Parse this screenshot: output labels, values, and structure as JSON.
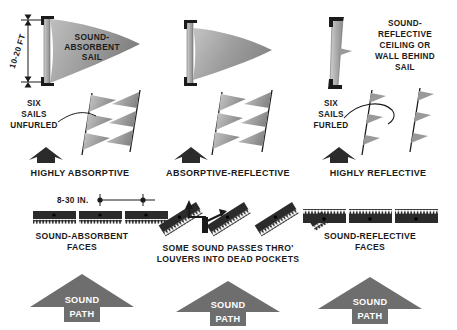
{
  "figure": {
    "colors": {
      "sail_light": "#c9c9c9",
      "sail_mid": "#9a9a9a",
      "sail_dark": "#7d7d7d",
      "mast_gray": "#b0b0b0",
      "ink": "#1a1a1a",
      "panel_dark": "#2b2b2b",
      "arrow_gray": "#6e6e6e",
      "path_arrow": "#6e6e6e",
      "background": "#ffffff"
    }
  },
  "top_row": {
    "panels": [
      {
        "id": "highly-absorptive",
        "dimension_label": "10-20 FT",
        "sail_label_lines": [
          "SOUND-",
          "ABSORBENT",
          "SAIL"
        ],
        "array_label_lines": [
          "SIX",
          "SAILS",
          "UNFURLED"
        ],
        "caption": "HIGHLY ABSORPTIVE"
      },
      {
        "id": "absorptive-reflective",
        "dimension_label": "",
        "sail_label_lines": [],
        "array_label_lines": [],
        "caption": "ABSORPTIVE-REFLECTIVE"
      },
      {
        "id": "highly-reflective",
        "dimension_label": "",
        "sail_label_lines": [
          "SOUND-",
          "REFLECTIVE",
          "CEILING OR",
          "WALL BEHIND",
          "SAIL"
        ],
        "array_label_lines": [
          "SIX",
          "SAILS",
          "FURLED"
        ],
        "caption": "HIGHLY REFLECTIVE"
      }
    ]
  },
  "bottom_row": {
    "panels": [
      {
        "id": "sound-absorbent-faces",
        "dimension_label": "8-30 IN.",
        "face_label_lines": [
          "SOUND-ABSORBENT",
          "FACES"
        ],
        "path_label_lines": [
          "SOUND",
          "PATH"
        ],
        "segments": 3,
        "teeth_edge": "bottom"
      },
      {
        "id": "louvers-dead-pockets",
        "dimension_label": "",
        "face_label_lines": [
          "SOME SOUND PASSES THRO'",
          "LOUVERS INTO DEAD POCKETS"
        ],
        "path_label_lines": [
          "SOUND",
          "PATH"
        ],
        "segments": 3,
        "teeth_edge": "angled"
      },
      {
        "id": "sound-reflective-faces",
        "dimension_label": "",
        "face_label_lines": [
          "SOUND-REFLECTIVE",
          "FACES"
        ],
        "path_label_lines": [
          "SOUND",
          "PATH"
        ],
        "segments": 3,
        "teeth_edge": "top"
      }
    ]
  }
}
